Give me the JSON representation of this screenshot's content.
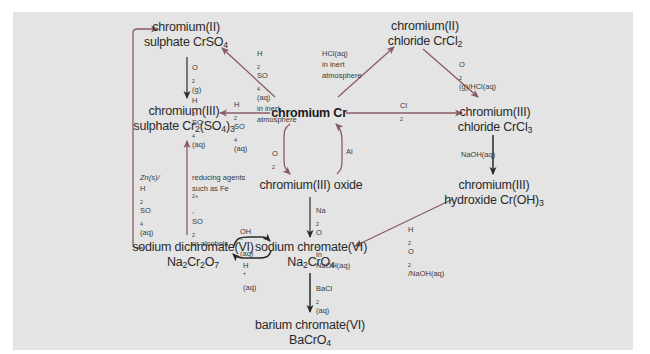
{
  "diagram": {
    "colors": {
      "background": "#e4e4e4",
      "arrow_red": "#8b5a62",
      "arrow_dark": "#3a3a3a",
      "text": "#2a2a2a"
    },
    "nodes": {
      "cr_metal": {
        "l1": "chromium Cr"
      },
      "cr2_sulphate": {
        "l1": "chromium(II)",
        "l2a": "sulphate CrSO",
        "l2sub": "4"
      },
      "cr3_sulphate": {
        "l1": "chromium(III)",
        "l2a": "sulphate Cr",
        "l2sub1": "2",
        "l2b": "(SO",
        "l2sub2": "4",
        "l2c": ")",
        "l2sub3": "3"
      },
      "cr2_chloride": {
        "l1": "chromium(II)",
        "l2a": "chloride CrCl",
        "l2sub": "2"
      },
      "cr3_chloride": {
        "l1": "chromium(III)",
        "l2a": "chloride CrCl",
        "l2sub": "3"
      },
      "cr3_oxide": {
        "l1": "chromium(III) oxide"
      },
      "cr3_hydroxide": {
        "l1": "chromium(III)",
        "l2a": "hydroxide Cr(OH)",
        "l2sub": "3"
      },
      "na_dichromate": {
        "l1": "sodium dichromate(VI)",
        "l2a": "Na",
        "l2sub1": "2",
        "l2b": "Cr",
        "l2sub2": "2",
        "l2c": "O",
        "l2sub3": "7"
      },
      "na_chromate": {
        "l1": "sodium chromate(VI)",
        "l2a": "Na",
        "l2sub1": "2",
        "l2b": "CrO",
        "l2sub2": "4"
      },
      "ba_chromate": {
        "l1": "barium chromate(VI)",
        "l2a": "BaCrO",
        "l2sub": "4"
      }
    },
    "conditions": {
      "cr_to_cr2sulphate": {
        "a1": "H",
        "s1": "2",
        "a2": "SO",
        "s2": "4",
        "a3": "(aq)",
        "l2": "in inert",
        "l3": "atmosphere"
      },
      "cr_to_cr2chloride": {
        "l1": "HCl(aq)",
        "l2": "in inert",
        "l3": "atmosphere"
      },
      "cr2sulphate_to_cr3sulphate": {
        "a1": "O",
        "s1": "2",
        "a2": "(g)",
        "b1": "H",
        "bs1": "2",
        "b2": "SO",
        "bs2": "4",
        "b3": "(aq)"
      },
      "cr_to_cr3sulphate": {
        "a1": "H",
        "s1": "2",
        "a2": "SO",
        "s2": "4",
        "a3": "(aq)"
      },
      "cr_to_cr3chloride": {
        "a1": "Cl",
        "s1": "2"
      },
      "cr2chloride_to_cr3chloride": {
        "a1": "O",
        "s1": "2",
        "a2": "(g)/HCl(aq)"
      },
      "cr_to_oxide": {
        "a1": "O",
        "s1": "2"
      },
      "oxide_to_cr": {
        "l1": "Al"
      },
      "cr3chloride_to_hydroxide": {
        "l1": "NaOH(aq)"
      },
      "oxide_to_chromate": {
        "a1": "Na",
        "s1": "2",
        "a2": "O",
        "s2": "2",
        "a3": " in",
        "l2": "NaOH(aq)"
      },
      "hydroxide_to_chromate": {
        "a1": "H",
        "s1": "2",
        "a2": "O",
        "s2": "2",
        "a3": "/NaOH(aq)"
      },
      "dichromate_to_cr3sulphate": {
        "l1": "reducing agents",
        "l2a": "such as Fe",
        "l2sup": "2+",
        "l2b": ",",
        "l3a": "SO",
        "l3sub": "2",
        "l3b": " or alcohols"
      },
      "dichromate_to_cr2sulphate": {
        "l1": "Zn(s)/",
        "a1": "H",
        "s1": "2",
        "a2": "SO",
        "s2": "4",
        "a3": "(aq)"
      },
      "dichromate_to_chromate": {
        "a1": "OH",
        "sup1": "−",
        "a2": "(aq)"
      },
      "chromate_to_dichromate": {
        "a1": "H",
        "sup1": "+",
        "a2": "(aq)"
      },
      "chromate_to_bachromate": {
        "a1": "BaCl",
        "s1": "2",
        "a2": "(aq)"
      }
    }
  }
}
